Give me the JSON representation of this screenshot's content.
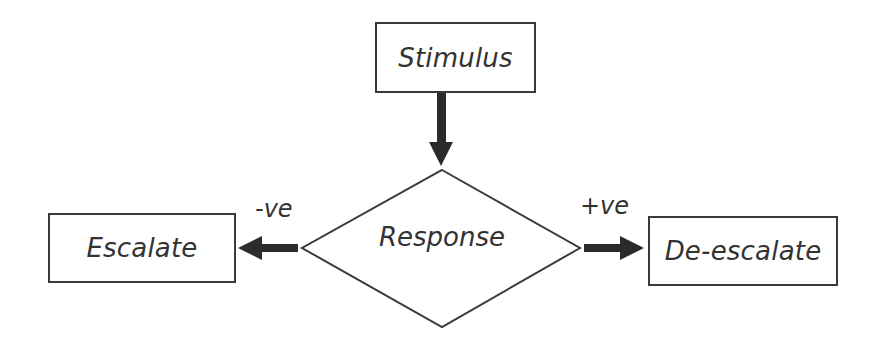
{
  "diagram": {
    "type": "flowchart",
    "nodes": {
      "stimulus": {
        "label": "Stimulus",
        "shape": "rectangle"
      },
      "response": {
        "label": "Response",
        "shape": "diamond"
      },
      "escalate": {
        "label": "Escalate",
        "shape": "rectangle"
      },
      "deescalate": {
        "label": "De-escalate",
        "shape": "rectangle"
      }
    },
    "edges": [
      {
        "from": "stimulus",
        "to": "response",
        "label": ""
      },
      {
        "from": "response",
        "to": "escalate",
        "label": "-ve"
      },
      {
        "from": "response",
        "to": "deescalate",
        "label": "+ve"
      }
    ],
    "colors": {
      "stroke": "#3a3a3a",
      "arrow": "#2b2b2b",
      "text": "#333333",
      "background": "#ffffff"
    }
  }
}
